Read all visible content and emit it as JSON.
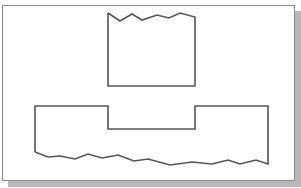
{
  "figure": {
    "frame": {
      "background": "#ffffff",
      "border_color": "#8a8a8a",
      "shadow_color": "#b8b8b8"
    },
    "line_color": "#555555",
    "line_width": 1.6,
    "shapes": {
      "upper_block": {
        "points": "108,13 120,21 132,14 142,20 157,15 169,18 180,13 195,17 195,86 108,86 108,13"
      },
      "lower_block": {
        "points": "35,152 35,106 108,106 108,129 195,129 195,106 268,106 268,164 256,160 240,164 228,160 212,164 192,162 170,165 148,159 134,161 118,155 102,158 88,154 75,159 60,156 48,157 35,152"
      }
    }
  }
}
